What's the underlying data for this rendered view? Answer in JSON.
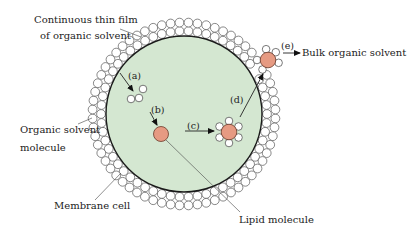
{
  "diagram": {
    "type": "schematic",
    "labels": {
      "film_line1": "Continuous thin film",
      "film_line2": "of organic solvent",
      "solvent_line1": "Organic solvent",
      "solvent_line2": "molecule",
      "membrane": "Membrane cell",
      "lipid": "Lipid molecule",
      "bulk": "Bulk organic solvent"
    },
    "steps": {
      "a": "(a)",
      "b": "(b)",
      "c": "(c)",
      "d": "(d)",
      "e": "(e)"
    },
    "colors": {
      "cell_fill": "#d4e7d1",
      "membrane_stroke": "#1a1a1a",
      "lipid_fill": "#e69a82",
      "solvent_fill": "#ffffff",
      "line": "#333333"
    }
  }
}
